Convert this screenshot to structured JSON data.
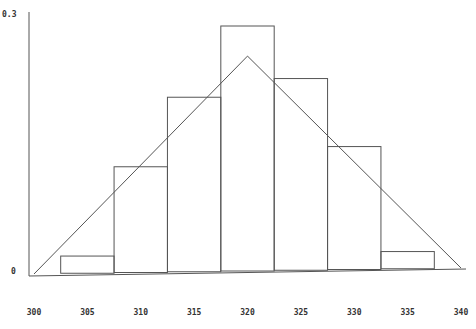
{
  "chart_data": {
    "type": "bar",
    "title": "",
    "xlabel": "",
    "ylabel": "",
    "x_ticks": [
      "300",
      "305",
      "310",
      "315",
      "320",
      "325",
      "330",
      "335",
      "340"
    ],
    "y_ticks": [
      "0",
      "0.3"
    ],
    "xlim": [
      300,
      340
    ],
    "ylim": [
      0,
      0.3
    ],
    "grid": false,
    "legend": null,
    "categories": [
      "305",
      "310",
      "315",
      "320",
      "325",
      "330",
      "335"
    ],
    "bin_edges": [
      302.5,
      307.5,
      312.5,
      317.5,
      322.5,
      327.5,
      332.5,
      337.5
    ],
    "series": [
      {
        "name": "histogram density",
        "type": "bar",
        "values": [
          0.02,
          0.123,
          0.203,
          0.285,
          0.223,
          0.143,
          0.02
        ]
      },
      {
        "name": "triangular density",
        "type": "line",
        "x": [
          300,
          320,
          340
        ],
        "values": [
          0,
          0.25,
          0
        ]
      }
    ]
  },
  "axes": {
    "y_top_label": "0.3",
    "y_zero_label": "0"
  }
}
